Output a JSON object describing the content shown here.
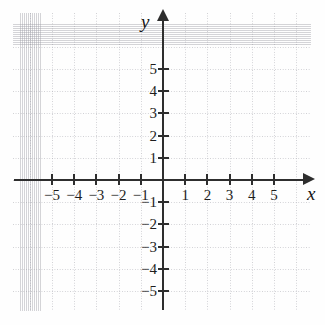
{
  "figure": {
    "kind": "cartesian-coordinate-plane",
    "background_color": "#fefefe",
    "axis_color": "#2e2e2e",
    "grid_color": "#9194a0",
    "label_color": "#1d1d1d"
  },
  "axes": {
    "x_label": "x",
    "y_label": "y",
    "x_arrow": "right",
    "y_arrow": "up"
  },
  "chart_data": {
    "type": "scatter",
    "title": "",
    "subtitle": "",
    "xlabel": "x",
    "ylabel": "y",
    "xlim": [
      -6.6,
      6.4
    ],
    "ylim": [
      -5.9,
      6.6
    ],
    "xticks": [
      -5,
      -4,
      -3,
      -2,
      -1,
      1,
      2,
      3,
      4,
      5
    ],
    "yticks": [
      -5,
      -4,
      -3,
      -2,
      -1,
      1,
      2,
      3,
      4,
      5
    ],
    "xticklabels": [
      "−5",
      "−4",
      "−3",
      "−2",
      "−1",
      "1",
      "2",
      "3",
      "4",
      "5"
    ],
    "yticklabels": [
      "−5",
      "−4",
      "−3",
      "−2",
      "−1",
      "1",
      "2",
      "3",
      "4",
      "5"
    ],
    "grid": true,
    "grid_style": "dotted",
    "grid_spacing": 1,
    "legend": null,
    "series": [],
    "annotations": [],
    "origin_label": ""
  },
  "ticks": {
    "x": [
      {
        "value": -5,
        "label": "−5"
      },
      {
        "value": -4,
        "label": "−4"
      },
      {
        "value": -3,
        "label": "−3"
      },
      {
        "value": -2,
        "label": "−2"
      },
      {
        "value": -1,
        "label": "−1"
      },
      {
        "value": 1,
        "label": "1"
      },
      {
        "value": 2,
        "label": "2"
      },
      {
        "value": 3,
        "label": "3"
      },
      {
        "value": 4,
        "label": "4"
      },
      {
        "value": 5,
        "label": "5"
      }
    ],
    "y": [
      {
        "value": 5,
        "label": "5"
      },
      {
        "value": 4,
        "label": "4"
      },
      {
        "value": 3,
        "label": "3"
      },
      {
        "value": 2,
        "label": "2"
      },
      {
        "value": 1,
        "label": "1"
      },
      {
        "value": -1,
        "label": "−1"
      },
      {
        "value": -2,
        "label": "−2"
      },
      {
        "value": -3,
        "label": "−3"
      },
      {
        "value": -4,
        "label": "−4"
      },
      {
        "value": -5,
        "label": "−5"
      }
    ]
  }
}
